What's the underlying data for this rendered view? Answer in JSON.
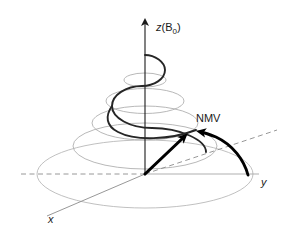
{
  "figure": {
    "background_color": "#ffffff",
    "width": 289,
    "height": 238
  },
  "colors": {
    "axis": "#1a1a1a",
    "spiral": "#262626",
    "vector": "#000000",
    "cone_lines": "#a8a8a8",
    "ellipse": "#a0a0a0",
    "dashed_axis": "#8c8c8c",
    "text": "#1a1a1a"
  },
  "axes": {
    "z": {
      "label_main": "z",
      "label_paren_open": "(B",
      "label_subscript": "0",
      "label_paren_close": ")",
      "full_label": "z(B0)",
      "direction": "vertical-up",
      "arrow": "up-arrow-head"
    },
    "y": {
      "label": "y",
      "direction": "right",
      "dashed_extension": true
    },
    "x": {
      "label": "x",
      "direction": "lower-left",
      "dashed_extension": true
    },
    "origin": {
      "x": 145,
      "y": 174
    }
  },
  "annotations": [
    {
      "id": "nmv",
      "label": "NMV",
      "meaning": "net-magnetization-vector",
      "x": 196,
      "y": 122
    }
  ],
  "vectors": [
    {
      "id": "nmv-vector",
      "name": "net-magnetization-vector-arrow",
      "from": {
        "x": 145,
        "y": 174
      },
      "to": {
        "x": 186,
        "y": 134
      },
      "style": "bold-solid-arrow"
    },
    {
      "id": "precession-path",
      "name": "precession-trajectory-arrow",
      "from": {
        "x": 248,
        "y": 175
      },
      "to": {
        "x": 196,
        "y": 134
      },
      "style": "bold-curved-arrow"
    }
  ],
  "spiral": {
    "name": "precession-spiral",
    "turns": 2.5,
    "top": {
      "x": 145,
      "y": 55
    },
    "bottom_radius_x": 62,
    "description": "widening helical spiral from z-axis top down to transverse plane"
  },
  "cone_ellipses": [
    {
      "cy": 80,
      "rx": 20,
      "ry": 7
    },
    {
      "cy": 101,
      "rx": 38,
      "ry": 12
    },
    {
      "cy": 123,
      "rx": 52,
      "ry": 16
    },
    {
      "cy": 145,
      "rx": 70,
      "ry": 22
    },
    {
      "cy": 174,
      "rx": 105,
      "ry": 33
    }
  ]
}
